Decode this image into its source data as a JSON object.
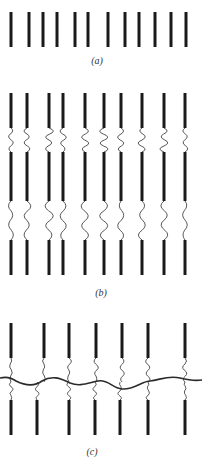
{
  "figure": {
    "panels": [
      {
        "id": "a",
        "label": "(a)",
        "label_pos": {
          "x": 97,
          "y": 55
        },
        "description": "Row of separated rigid fiber segments",
        "bars": {
          "x": [
            11,
            29,
            43,
            57,
            75,
            88,
            108,
            125,
            139,
            155,
            171,
            186
          ],
          "y_top": 12,
          "y_bottom": 47
        }
      },
      {
        "id": "b",
        "label": "(b)",
        "label_pos": {
          "x": 101,
          "y": 287
        },
        "description": "Fiber segments linked by wavy flexible connectors",
        "strands": {
          "x": [
            11,
            27,
            49,
            63,
            85,
            104,
            121,
            142,
            164,
            185
          ],
          "segments": [
            [
              93,
              128
            ],
            [
              152,
              201
            ],
            [
              240,
              275
            ]
          ]
        }
      },
      {
        "id": "c",
        "label": "(c)",
        "label_pos": {
          "x": 92,
          "y": 446
        },
        "description": "Fiber segments bridged by a continuous horizontal thread",
        "upper_bars": {
          "x": [
            11,
            44,
            69,
            96,
            122,
            148,
            185
          ],
          "y_top": 323,
          "y_bottom": 358
        },
        "lower_bars": {
          "x": [
            11,
            37,
            69,
            95,
            120,
            148,
            185
          ],
          "y_top": 400,
          "y_bottom": 435
        }
      }
    ]
  }
}
